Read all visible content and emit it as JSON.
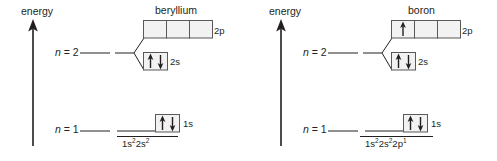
{
  "figure": {
    "type": "orbital-energy-diagram",
    "background_color": "#ffffff",
    "ink_color": "#231f20",
    "box_fill_color": "#f2f2f2",
    "box_stroke_color": "#58595b"
  },
  "panels": [
    {
      "id": "beryllium",
      "title": "beryllium",
      "axis_label": "energy",
      "levels": [
        {
          "id": "n2",
          "label_n": "n",
          "label_eq": " = ",
          "label_num": "2"
        },
        {
          "id": "n1",
          "label_n": "n",
          "label_eq": " = ",
          "label_num": "1"
        }
      ],
      "orbitals": [
        {
          "id": "2p",
          "label": "2p",
          "boxes": 3,
          "electrons": [
            [],
            [],
            []
          ]
        },
        {
          "id": "2s",
          "label": "2s",
          "boxes": 1,
          "electrons": [
            [
              "up",
              "down"
            ]
          ]
        },
        {
          "id": "1s",
          "label": "1s",
          "boxes": 1,
          "electrons": [
            [
              "up",
              "down"
            ]
          ]
        }
      ],
      "configuration": {
        "parts": [
          {
            "base": "1s",
            "sup": "2"
          },
          {
            "base": "2s",
            "sup": "2"
          }
        ],
        "plain": "1s2 2s2"
      }
    },
    {
      "id": "boron",
      "title": "boron",
      "axis_label": "energy",
      "levels": [
        {
          "id": "n2",
          "label_n": "n",
          "label_eq": " = ",
          "label_num": "2"
        },
        {
          "id": "n1",
          "label_n": "n",
          "label_eq": " = ",
          "label_num": "1"
        }
      ],
      "orbitals": [
        {
          "id": "2p",
          "label": "2p",
          "boxes": 3,
          "electrons": [
            [
              "up"
            ],
            [],
            []
          ]
        },
        {
          "id": "2s",
          "label": "2s",
          "boxes": 1,
          "electrons": [
            [
              "up",
              "down"
            ]
          ]
        },
        {
          "id": "1s",
          "label": "1s",
          "boxes": 1,
          "electrons": [
            [
              "up",
              "down"
            ]
          ]
        }
      ],
      "configuration": {
        "parts": [
          {
            "base": "1s",
            "sup": "2"
          },
          {
            "base": "2s",
            "sup": "2"
          },
          {
            "base": "2p",
            "sup": "1"
          }
        ],
        "plain": "1s2 2s2 2p1"
      }
    }
  ]
}
